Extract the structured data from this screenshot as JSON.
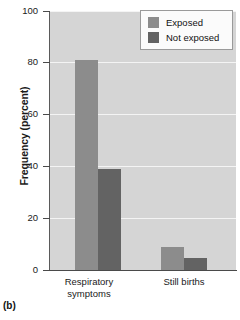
{
  "chart_data": {
    "type": "bar",
    "title": "",
    "subtitle": "",
    "xlabel": "",
    "ylabel": "Frequency (percent)",
    "ylim": [
      0,
      100
    ],
    "yticks": [
      0,
      20,
      40,
      60,
      80,
      100
    ],
    "ytick_labels": [
      "0",
      "20",
      "40",
      "60",
      "80",
      "100"
    ],
    "grid": "horizontal",
    "legend_position": "top-right",
    "categories": [
      "Respiratory\nsymptoms",
      "Still births"
    ],
    "series": [
      {
        "name": "Exposed",
        "color": "#8c8c8c",
        "values": [
          81,
          9
        ]
      },
      {
        "name": "Not exposed",
        "color": "#636363",
        "values": [
          39,
          4.5
        ]
      }
    ],
    "annotations": [
      "(b)"
    ]
  },
  "figure": {
    "panel_caption": "(b)",
    "y_axis_title": "Frequency (percent)",
    "plot_background_color": "#d5d5d5",
    "gridline_color": "#f4f4f4",
    "axis_color": "#4a4a4a"
  },
  "legend": {
    "items": [
      {
        "label": "Exposed",
        "color": "#8c8c8c"
      },
      {
        "label": "Not exposed",
        "color": "#636363"
      }
    ]
  },
  "axes": {
    "y_tick_labels": [
      "100",
      "80",
      "60",
      "40",
      "20",
      "0"
    ],
    "x_tick_labels": [
      "Respiratory\nsymptoms",
      "Still births"
    ]
  }
}
